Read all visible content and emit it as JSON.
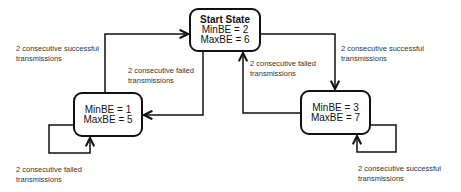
{
  "diagram": {
    "type": "state-machine",
    "states": [
      {
        "id": "start",
        "title": "Start State",
        "lines": [
          "MinBE = 2",
          "MaxBE = 6"
        ]
      },
      {
        "id": "low",
        "title": "",
        "lines": [
          "MinBE = 1",
          "MaxBE = 5"
        ]
      },
      {
        "id": "high",
        "title": "",
        "lines": [
          "MinBE = 3",
          "MaxBE = 7"
        ]
      }
    ],
    "transitions": [
      {
        "from": "low",
        "to": "start",
        "label": [
          "2 consecutive successful",
          "transmissions"
        ]
      },
      {
        "from": "start",
        "to": "high",
        "label": [
          "2 consecutive successful",
          "transmissions"
        ]
      },
      {
        "from": "start",
        "to": "low",
        "label": [
          "2 consecutive failed",
          "transmissions"
        ]
      },
      {
        "from": "high",
        "to": "start",
        "label": [
          "2 consecutive failed",
          "transmissions"
        ]
      },
      {
        "from": "low",
        "to": "low",
        "label": [
          "2 consecutive failed",
          "transmissions"
        ]
      },
      {
        "from": "high",
        "to": "high",
        "label": [
          "2 consecutive successful",
          "transmissions"
        ]
      }
    ]
  },
  "colors": {
    "stroke": "#111111",
    "text": "#333333",
    "background": "#ffffff"
  }
}
